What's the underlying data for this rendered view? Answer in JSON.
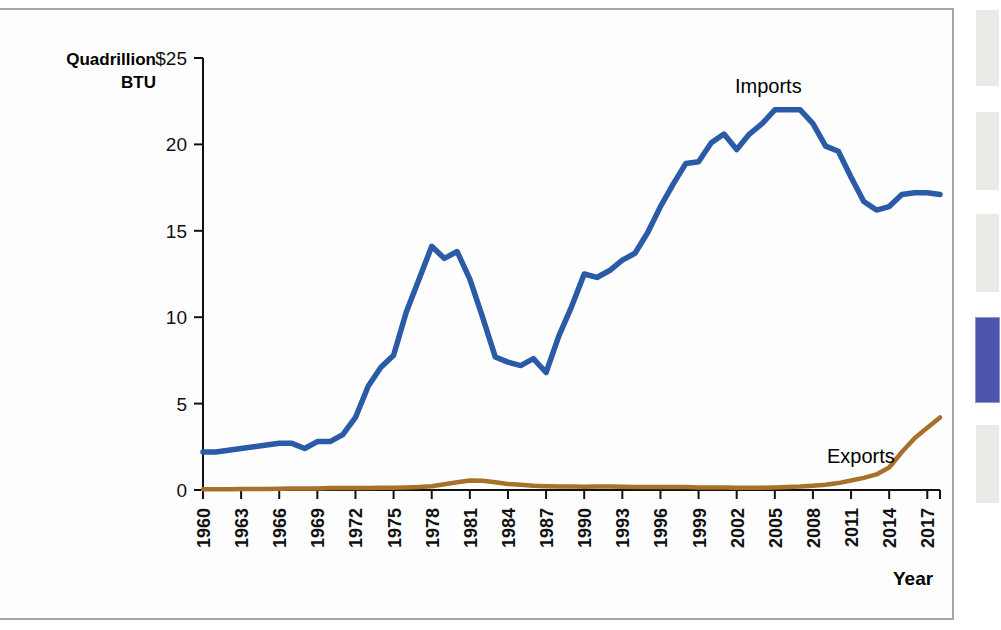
{
  "page": {
    "border_color": "#a9a7a2"
  },
  "side_strip": {
    "name": "thumbnail-strip",
    "tabs": [
      {
        "name": "thumb-1",
        "top": 10,
        "height": 76,
        "active": false
      },
      {
        "name": "thumb-2",
        "top": 112,
        "height": 78,
        "active": false
      },
      {
        "name": "thumb-3",
        "top": 214,
        "height": 78,
        "active": false
      },
      {
        "name": "thumb-4",
        "top": 317,
        "height": 84,
        "active": true
      },
      {
        "name": "thumb-5",
        "top": 425,
        "height": 78,
        "active": false
      }
    ]
  },
  "chart_data": {
    "type": "line",
    "title": "",
    "xlabel": "Year",
    "ylabel": "Quadrillion BTU",
    "y_unit_prefix": "$",
    "ylim": [
      0,
      25
    ],
    "xlim": [
      1960,
      2018
    ],
    "grid": false,
    "legend_position": "inline-annotation",
    "y_ticks": [
      "0",
      "5",
      "10",
      "15",
      "20",
      "$25"
    ],
    "y_tick_values": [
      0,
      5,
      10,
      15,
      20,
      25
    ],
    "x_ticks": [
      "1960",
      "1963",
      "1966",
      "1969",
      "1972",
      "1975",
      "1978",
      "1981",
      "1984",
      "1987",
      "1990",
      "1993",
      "1996",
      "1999",
      "2002",
      "2005",
      "2008",
      "2011",
      "2014",
      "2017"
    ],
    "x_tick_values": [
      1960,
      1963,
      1966,
      1969,
      1972,
      1975,
      1978,
      1981,
      1984,
      1987,
      1990,
      1993,
      1996,
      1999,
      2002,
      2005,
      2008,
      2011,
      2014,
      2017
    ],
    "x": [
      1960,
      1961,
      1962,
      1963,
      1964,
      1965,
      1966,
      1967,
      1968,
      1969,
      1970,
      1971,
      1972,
      1973,
      1974,
      1975,
      1976,
      1977,
      1978,
      1979,
      1980,
      1981,
      1982,
      1983,
      1984,
      1985,
      1986,
      1987,
      1988,
      1989,
      1990,
      1991,
      1992,
      1993,
      1994,
      1995,
      1996,
      1997,
      1998,
      1999,
      2000,
      2001,
      2002,
      2003,
      2004,
      2005,
      2006,
      2007,
      2008,
      2009,
      2010,
      2011,
      2012,
      2013,
      2014,
      2015,
      2016,
      2017,
      2018
    ],
    "series": [
      {
        "name": "Imports",
        "label": "Imports",
        "color": "#2b5aa6",
        "values": [
          2.2,
          2.2,
          2.3,
          2.4,
          2.5,
          2.6,
          2.7,
          2.7,
          2.4,
          2.8,
          2.8,
          3.2,
          4.2,
          6.0,
          7.1,
          7.8,
          10.3,
          12.2,
          14.1,
          13.4,
          13.8,
          12.2,
          10.0,
          7.7,
          7.4,
          7.2,
          7.6,
          6.8,
          8.9,
          10.6,
          12.5,
          12.3,
          12.7,
          13.3,
          13.7,
          14.9,
          16.4,
          17.7,
          18.9,
          19.0,
          20.1,
          20.6,
          19.7,
          20.6,
          21.2,
          22.0,
          22.0,
          22.0,
          21.2,
          19.9,
          19.6,
          18.1,
          16.7,
          16.2,
          16.4,
          17.1,
          17.2,
          17.2,
          17.1
        ]
      },
      {
        "name": "Exports",
        "label": "Exports",
        "color": "#a8702a",
        "values": [
          0.04,
          0.04,
          0.05,
          0.06,
          0.06,
          0.06,
          0.07,
          0.08,
          0.08,
          0.08,
          0.11,
          0.11,
          0.11,
          0.12,
          0.13,
          0.13,
          0.15,
          0.17,
          0.22,
          0.33,
          0.45,
          0.55,
          0.53,
          0.45,
          0.35,
          0.3,
          0.25,
          0.22,
          0.2,
          0.2,
          0.19,
          0.2,
          0.2,
          0.19,
          0.18,
          0.18,
          0.18,
          0.18,
          0.17,
          0.15,
          0.15,
          0.15,
          0.13,
          0.13,
          0.13,
          0.15,
          0.17,
          0.2,
          0.25,
          0.3,
          0.4,
          0.55,
          0.7,
          0.9,
          1.3,
          2.2,
          3.0,
          3.6,
          4.2
        ]
      }
    ],
    "annotations": [
      {
        "name": "imports-label",
        "text": "Imports",
        "x_px": 735,
        "y_px": 93
      },
      {
        "name": "exports-label",
        "text": "Exports",
        "x_px": 827,
        "y_px": 463
      }
    ]
  }
}
